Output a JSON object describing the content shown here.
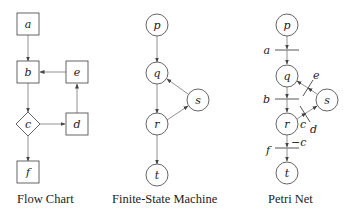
{
  "flow_chart": {
    "caption": "Flow Chart",
    "nodes": {
      "a": "a",
      "b": "b",
      "c": "c",
      "d": "d",
      "e": "e",
      "f": "f"
    },
    "edges": [
      [
        "a",
        "b"
      ],
      [
        "b",
        "c"
      ],
      [
        "c",
        "d"
      ],
      [
        "d",
        "e"
      ],
      [
        "e",
        "b"
      ],
      [
        "c",
        "f"
      ]
    ]
  },
  "fsm": {
    "caption": "Finite-State Machine",
    "nodes": {
      "p": "p",
      "q": "q",
      "r": "r",
      "s": "s",
      "t": "t"
    },
    "edges": [
      [
        "p",
        "q"
      ],
      [
        "q",
        "r"
      ],
      [
        "r",
        "s"
      ],
      [
        "s",
        "q"
      ],
      [
        "r",
        "t"
      ]
    ]
  },
  "petri": {
    "caption": "Petri Net",
    "places": {
      "p": "p",
      "q": "q",
      "r": "r",
      "s": "s",
      "t": "t"
    },
    "transitions": {
      "a": "a",
      "b": "b",
      "d": "d",
      "e": "e",
      "f": "f"
    },
    "arc_labels": {
      "c1": "c",
      "c2": "c"
    }
  }
}
